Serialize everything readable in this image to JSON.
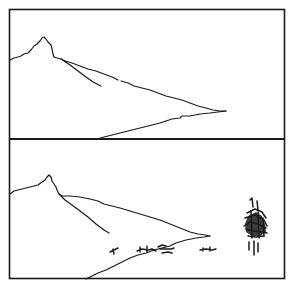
{
  "figure": {
    "line_color": "#1a1a1a",
    "background": "#ffffff",
    "panels": [
      {
        "id": "top",
        "label": "headland-empty"
      },
      {
        "id": "bottom",
        "label": "headland-with-ships"
      }
    ]
  }
}
